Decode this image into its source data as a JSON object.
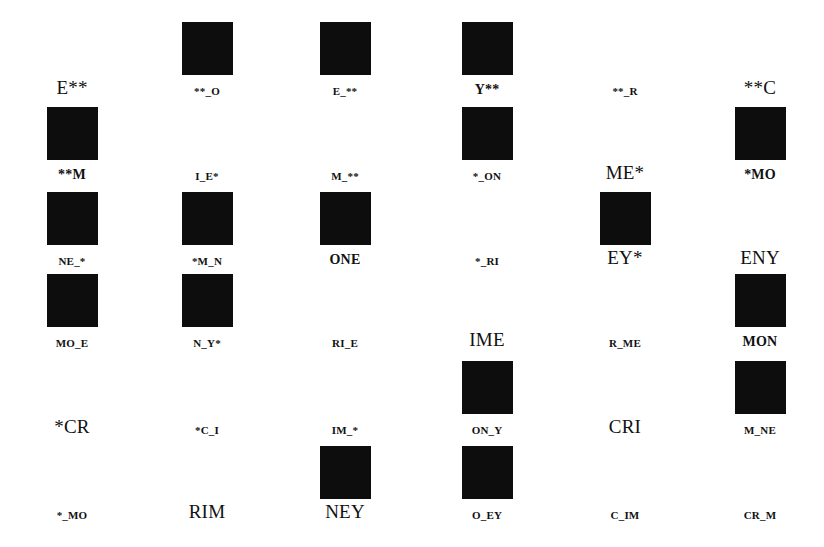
{
  "grid": {
    "rows": 6,
    "cols": 6,
    "cells": [
      [
        {
          "label": "E**",
          "filled": false,
          "size": "big"
        },
        {
          "label": "**_O",
          "filled": true,
          "size": "small"
        },
        {
          "label": "E_**",
          "filled": true,
          "size": "small"
        },
        {
          "label": "Y**",
          "filled": true,
          "size": "med"
        },
        {
          "label": "**_R",
          "filled": false,
          "size": "small"
        },
        {
          "label": "**C",
          "filled": false,
          "size": "big"
        }
      ],
      [
        {
          "label": "**M",
          "filled": true,
          "size": "med"
        },
        {
          "label": "I_E*",
          "filled": false,
          "size": "small"
        },
        {
          "label": "M_**",
          "filled": false,
          "size": "small"
        },
        {
          "label": "*_ON",
          "filled": true,
          "size": "small"
        },
        {
          "label": "ME*",
          "filled": false,
          "size": "big"
        },
        {
          "label": "*MO",
          "filled": true,
          "size": "med"
        }
      ],
      [
        {
          "label": "NE_*",
          "filled": true,
          "size": "small"
        },
        {
          "label": "*M_N",
          "filled": true,
          "size": "small"
        },
        {
          "label": "ONE",
          "filled": true,
          "size": "med"
        },
        {
          "label": "*_RI",
          "filled": false,
          "size": "small"
        },
        {
          "label": "EY*",
          "filled": true,
          "size": "big"
        },
        {
          "label": "ENY",
          "filled": false,
          "size": "big"
        }
      ],
      [
        {
          "label": "MO_E",
          "filled": true,
          "size": "small"
        },
        {
          "label": "N_Y*",
          "filled": true,
          "size": "small"
        },
        {
          "label": "RI_E",
          "filled": false,
          "size": "small"
        },
        {
          "label": "IME",
          "filled": false,
          "size": "big"
        },
        {
          "label": "R_ME",
          "filled": false,
          "size": "small"
        },
        {
          "label": "MON",
          "filled": true,
          "size": "med"
        }
      ],
      [
        {
          "label": "*CR",
          "filled": false,
          "size": "big"
        },
        {
          "label": "*C_I",
          "filled": false,
          "size": "small"
        },
        {
          "label": "IM_*",
          "filled": false,
          "size": "small"
        },
        {
          "label": "ON_Y",
          "filled": true,
          "size": "small"
        },
        {
          "label": "CRI",
          "filled": false,
          "size": "big"
        },
        {
          "label": "M_NE",
          "filled": true,
          "size": "small"
        }
      ],
      [
        {
          "label": "*_MO",
          "filled": false,
          "size": "small"
        },
        {
          "label": "RIM",
          "filled": false,
          "size": "big"
        },
        {
          "label": "NEY",
          "filled": true,
          "size": "big"
        },
        {
          "label": "O_EY",
          "filled": true,
          "size": "small"
        },
        {
          "label": "C_IM",
          "filled": false,
          "size": "small"
        },
        {
          "label": "CR_M",
          "filled": false,
          "size": "small"
        }
      ]
    ]
  },
  "colors": {
    "square": "#0d0d0d",
    "background": "#ffffff",
    "text": "#111111"
  }
}
